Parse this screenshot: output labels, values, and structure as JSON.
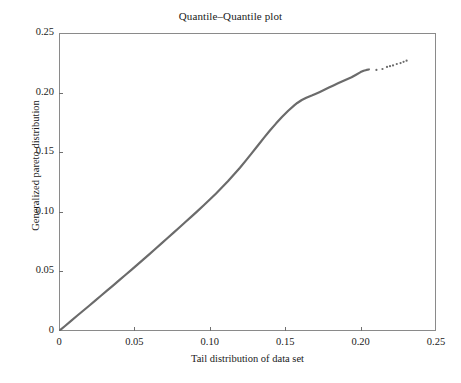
{
  "chart_data": {
    "type": "scatter",
    "title": "Quantile–Quantile plot",
    "xlabel": "Tail distribution of data set",
    "ylabel": "Generalized pareto distribution",
    "xlim": [
      0,
      0.25
    ],
    "ylim": [
      0,
      0.25
    ],
    "grid": false,
    "legend": null,
    "series_color": "#6b6b6b",
    "frame_color": "#8a8a8a",
    "x_ticks": [
      0,
      0.05,
      0.1,
      0.15,
      0.2,
      0.25
    ],
    "x_tick_labels": [
      "0",
      "0.05",
      "0.10",
      "0.15",
      "0.20",
      "0.25"
    ],
    "y_ticks": [
      0,
      0.05,
      0.1,
      0.15,
      0.2,
      0.25
    ],
    "y_tick_labels": [
      "0",
      "0.05",
      "0.10",
      "0.15",
      "0.20",
      "0.25"
    ],
    "series": [
      {
        "name": "qq-dense-curve",
        "style": "dense-points",
        "x": [
          0.0,
          0.004,
          0.008,
          0.012,
          0.016,
          0.02,
          0.024,
          0.028,
          0.032,
          0.036,
          0.04,
          0.044,
          0.048,
          0.052,
          0.056,
          0.06,
          0.064,
          0.068,
          0.072,
          0.076,
          0.08,
          0.084,
          0.088,
          0.092,
          0.096,
          0.1,
          0.104,
          0.108,
          0.112,
          0.116,
          0.12,
          0.124,
          0.128,
          0.132,
          0.136,
          0.14,
          0.144,
          0.148,
          0.152,
          0.156,
          0.158,
          0.161,
          0.164,
          0.166,
          0.168,
          0.17,
          0.173,
          0.176,
          0.179,
          0.182,
          0.185,
          0.188,
          0.191,
          0.194,
          0.197,
          0.2,
          0.202,
          0.204,
          0.2055
        ],
        "y": [
          0.0,
          0.0042,
          0.0085,
          0.0128,
          0.017,
          0.0212,
          0.0255,
          0.0298,
          0.034,
          0.0383,
          0.0427,
          0.047,
          0.0513,
          0.0557,
          0.0601,
          0.0645,
          0.069,
          0.0735,
          0.078,
          0.0825,
          0.087,
          0.0916,
          0.0962,
          0.1008,
          0.1055,
          0.1103,
          0.1152,
          0.1203,
          0.1256,
          0.1312,
          0.137,
          0.1431,
          0.1494,
          0.1558,
          0.1622,
          0.1684,
          0.1742,
          0.1797,
          0.1848,
          0.1893,
          0.1913,
          0.1938,
          0.1957,
          0.1968,
          0.1978,
          0.1989,
          0.2006,
          0.2024,
          0.2042,
          0.206,
          0.2078,
          0.2096,
          0.2113,
          0.2129,
          0.215,
          0.2172,
          0.2183,
          0.219,
          0.2194
        ]
      },
      {
        "name": "qq-sparse-tail-points",
        "style": "isolated-points",
        "x": [
          0.2105,
          0.2145,
          0.2175,
          0.2195,
          0.2215,
          0.224,
          0.2265,
          0.2285,
          0.2305
        ],
        "y": [
          0.219,
          0.2198,
          0.2215,
          0.2222,
          0.2228,
          0.224,
          0.2248,
          0.2258,
          0.2268
        ]
      }
    ]
  }
}
